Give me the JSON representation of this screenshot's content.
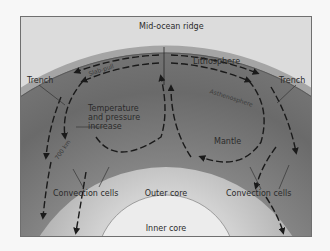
{
  "diagram": {
    "labels": {
      "mid_ocean_ridge": "Mid-ocean ridge",
      "lithosphere": "Lithosphere",
      "trench_left": "Trench",
      "trench_right": "Trench",
      "slab_pull": "Slab-pull",
      "asthenosphere": "Asthenosphere",
      "temperature_pressure": "Temperature and pressure increase",
      "depth": "700 km",
      "mantle": "Mantle",
      "convection_left": "Convection cells",
      "convection_right": "Convection cells",
      "outer_core": "Outer core",
      "inner_core": "Inner core"
    },
    "colors": {
      "background": "#f7f7f7",
      "sky": "#dcdcdc",
      "lithosphere": "#9a9a9a",
      "mantle": "#6e6e6e",
      "outer_core": "#b4b4b4",
      "inner_core": "#ececec",
      "arrows": "#1a1a1a"
    }
  }
}
